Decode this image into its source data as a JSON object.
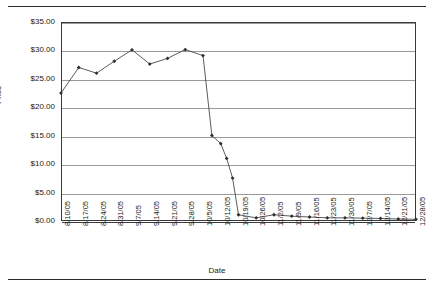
{
  "chart_data": {
    "type": "line",
    "title": "",
    "xlabel": "Date",
    "ylabel": "Price",
    "grid": "horizontal",
    "legend": "none",
    "ylim": [
      0,
      35
    ],
    "ytick_labels": [
      "$35.00",
      "$30.00",
      "$25.00",
      "$20.00",
      "$15.00",
      "$10.00",
      "$5.00",
      "$0.00"
    ],
    "ytick_values": [
      35,
      30,
      25,
      20,
      15,
      10,
      5,
      0
    ],
    "categories": [
      "8/10/05",
      "8/17/05",
      "8/24/05",
      "8/31/05",
      "9/7/05",
      "9/14/05",
      "9/21/05",
      "9/28/05",
      "10/5/05",
      "10/12/05",
      "10/19/05",
      "10/26/05",
      "11/2/05",
      "11/9/05",
      "11/16/05",
      "11/23/05",
      "11/30/05",
      "12/7/05",
      "12/14/05",
      "12/21/05",
      "12/28/05"
    ],
    "values": [
      22.5,
      27.0,
      26.0,
      28.1,
      30.1,
      27.6,
      28.6,
      30.15,
      29.1,
      13.6,
      1.1,
      0.55,
      1.1,
      0.85,
      0.7,
      0.55,
      0.55,
      0.5,
      0.45,
      0.35,
      0.3
    ],
    "intermediate_points": [
      {
        "after_index": 8,
        "value": 15.05
      },
      {
        "after_index": 9,
        "value": 11.0
      },
      {
        "after_index": 9,
        "value": 7.55
      }
    ],
    "marker": "diamond",
    "line_color": "#4a4a4a",
    "marker_color": "#2e2e2e",
    "gridline_color": "#9a9a9a",
    "axis_color": "#3a3a3a",
    "background": "#ffffff"
  }
}
